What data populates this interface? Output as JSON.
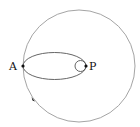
{
  "diagram": {
    "type": "orbit-transfer",
    "labels": {
      "apoapsis": "A",
      "periapsis": "P"
    },
    "elements": [
      {
        "name": "outer-circular-orbit",
        "shape": "circle",
        "cx": 79,
        "cy": 66,
        "r": 56
      },
      {
        "name": "elliptical-transfer-orbit",
        "shape": "ellipse",
        "cx": 54.5,
        "cy": 66,
        "rx": 31.5,
        "ry": 13.5
      },
      {
        "name": "inner-circular-orbit",
        "shape": "circle",
        "cx": 80.5,
        "cy": 66,
        "r": 5.5
      }
    ],
    "points": [
      {
        "name": "point-A",
        "x": 23,
        "y": 66
      },
      {
        "name": "point-P",
        "x": 86,
        "y": 66
      },
      {
        "name": "direction-marker",
        "x": 33,
        "y": 99
      }
    ],
    "colors": {
      "outer_circle": "#9a9a9a",
      "ellipse": "#555555",
      "points": "#111111"
    }
  }
}
